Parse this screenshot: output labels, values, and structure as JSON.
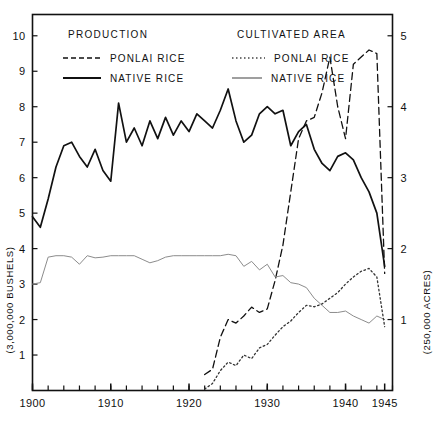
{
  "legend": {
    "groups": [
      {
        "title": "PRODUCTION",
        "entries": [
          {
            "label": "PONLAI RICE",
            "style": "dashed",
            "color": "#111111"
          },
          {
            "label": "NATIVE RICE",
            "style": "solid",
            "color": "#111111"
          }
        ]
      },
      {
        "title": "CULTIVATED AREA",
        "entries": [
          {
            "label": "PONLAI RICE",
            "style": "dotted",
            "color": "#444444"
          },
          {
            "label": "NATIVE RICE",
            "style": "solid-thin",
            "color": "#888888"
          }
        ]
      }
    ]
  },
  "axes": {
    "left_title": "(3,000,000 BUSHELS)",
    "right_title": "(250,000 ACRES)",
    "left_ticks": [
      "1",
      "2",
      "3",
      "4",
      "5",
      "6",
      "7",
      "8",
      "9",
      "10"
    ],
    "right_ticks": [
      "1",
      "2",
      "3",
      "4",
      "5"
    ],
    "x_ticks": [
      "1900",
      "1910",
      "1920",
      "1930",
      "1940",
      "1945"
    ],
    "x_range": [
      1900,
      1946
    ],
    "left_range": [
      0,
      10.6
    ],
    "right_range": [
      0,
      5.3
    ],
    "x_minor_step": 2
  },
  "chart_data": {
    "type": "line",
    "title": "",
    "xlabel": "",
    "ylabel": "(3,000,000 BUSHELS)",
    "y2label": "(250,000 ACRES)",
    "xlim": [
      1900,
      1946
    ],
    "ylim": [
      0,
      10.6
    ],
    "y2lim": [
      0,
      5.3
    ],
    "grid": false,
    "legend_position": "top-inside",
    "series": [
      {
        "name": "PRODUCTION NATIVE RICE",
        "axis": "left",
        "style": "solid",
        "color": "#111111",
        "width": 1.7,
        "x": [
          1900,
          1901,
          1902,
          1903,
          1904,
          1905,
          1906,
          1907,
          1908,
          1909,
          1910,
          1911,
          1912,
          1913,
          1914,
          1915,
          1916,
          1917,
          1918,
          1919,
          1920,
          1921,
          1922,
          1923,
          1924,
          1925,
          1926,
          1927,
          1928,
          1929,
          1930,
          1931,
          1932,
          1933,
          1934,
          1935,
          1936,
          1937,
          1938,
          1939,
          1940,
          1941,
          1942,
          1943,
          1944,
          1945
        ],
        "y": [
          4.9,
          4.6,
          5.4,
          6.3,
          6.9,
          7.0,
          6.6,
          6.3,
          6.8,
          6.2,
          5.9,
          8.1,
          7.0,
          7.4,
          6.9,
          7.6,
          7.1,
          7.7,
          7.2,
          7.6,
          7.3,
          7.8,
          7.6,
          7.4,
          7.9,
          8.5,
          7.6,
          7.0,
          7.2,
          7.8,
          8.0,
          7.8,
          7.9,
          6.9,
          7.3,
          7.5,
          6.8,
          6.4,
          6.2,
          6.6,
          6.7,
          6.5,
          6.0,
          5.6,
          5.0,
          3.5
        ]
      },
      {
        "name": "PRODUCTION PONLAI RICE",
        "axis": "left",
        "style": "dashed",
        "color": "#111111",
        "width": 1.3,
        "x": [
          1922,
          1923,
          1924,
          1925,
          1926,
          1927,
          1928,
          1929,
          1930,
          1931,
          1932,
          1933,
          1934,
          1935,
          1936,
          1937,
          1938,
          1939,
          1940,
          1941,
          1942,
          1943,
          1944,
          1945
        ],
        "y": [
          0.45,
          0.6,
          1.5,
          2.0,
          1.9,
          2.1,
          2.35,
          2.2,
          2.3,
          3.1,
          4.1,
          5.6,
          7.1,
          7.6,
          7.7,
          8.4,
          9.4,
          8.0,
          7.1,
          9.2,
          9.4,
          9.6,
          9.5,
          3.3
        ]
      },
      {
        "name": "CULTIVATED AREA NATIVE RICE",
        "axis": "right",
        "style": "solid-thin",
        "color": "#8c8c8c",
        "width": 1.0,
        "x": [
          1900,
          1901,
          1902,
          1903,
          1904,
          1905,
          1906,
          1907,
          1908,
          1909,
          1910,
          1911,
          1912,
          1913,
          1914,
          1915,
          1916,
          1917,
          1918,
          1919,
          1920,
          1921,
          1922,
          1923,
          1924,
          1925,
          1926,
          1927,
          1928,
          1929,
          1930,
          1931,
          1932,
          1933,
          1934,
          1935,
          1936,
          1937,
          1938,
          1939,
          1940,
          1941,
          1942,
          1943,
          1944,
          1945
        ],
        "y": [
          1.5,
          1.52,
          1.88,
          1.9,
          1.9,
          1.88,
          1.78,
          1.9,
          1.87,
          1.88,
          1.9,
          1.9,
          1.9,
          1.9,
          1.85,
          1.8,
          1.83,
          1.88,
          1.9,
          1.9,
          1.9,
          1.9,
          1.9,
          1.9,
          1.9,
          1.92,
          1.9,
          1.75,
          1.82,
          1.7,
          1.78,
          1.6,
          1.62,
          1.52,
          1.5,
          1.45,
          1.3,
          1.2,
          1.1,
          1.1,
          1.12,
          1.05,
          1.0,
          0.95,
          1.05,
          1.0
        ]
      },
      {
        "name": "CULTIVATED AREA PONLAI RICE",
        "axis": "right",
        "style": "dotted",
        "color": "#333333",
        "width": 1.3,
        "x": [
          1922,
          1923,
          1924,
          1925,
          1926,
          1927,
          1928,
          1929,
          1930,
          1931,
          1932,
          1933,
          1934,
          1935,
          1936,
          1937,
          1938,
          1939,
          1940,
          1941,
          1942,
          1943,
          1944,
          1945
        ],
        "y": [
          0.02,
          0.1,
          0.28,
          0.4,
          0.35,
          0.5,
          0.45,
          0.6,
          0.65,
          0.78,
          0.9,
          0.98,
          1.1,
          1.2,
          1.18,
          1.22,
          1.3,
          1.38,
          1.5,
          1.6,
          1.68,
          1.72,
          1.6,
          0.9
        ]
      }
    ]
  }
}
